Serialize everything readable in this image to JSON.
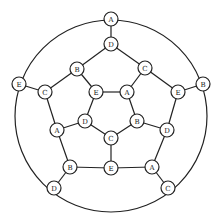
{
  "diagram": {
    "type": "graph",
    "outer_circle": {
      "cx": 111,
      "cy": 116,
      "r": 96
    },
    "nodes": [
      {
        "id": "n0",
        "label": "A",
        "x": 111,
        "y": 19
      },
      {
        "id": "n1",
        "label": "B",
        "x": 203,
        "y": 84
      },
      {
        "id": "n2",
        "label": "C",
        "x": 168,
        "y": 188
      },
      {
        "id": "n3",
        "label": "D",
        "x": 54,
        "y": 188
      },
      {
        "id": "n4",
        "label": "E",
        "x": 19,
        "y": 84
      },
      {
        "id": "m0",
        "label": "D",
        "x": 111,
        "y": 44
      },
      {
        "id": "m1",
        "label": "C",
        "x": 145,
        "y": 68
      },
      {
        "id": "m2",
        "label": "E",
        "x": 178,
        "y": 92
      },
      {
        "id": "m3",
        "label": "D",
        "x": 167,
        "y": 130
      },
      {
        "id": "m4",
        "label": "A",
        "x": 152,
        "y": 167
      },
      {
        "id": "m5",
        "label": "E",
        "x": 111,
        "y": 168
      },
      {
        "id": "m6",
        "label": "B",
        "x": 70,
        "y": 167
      },
      {
        "id": "m7",
        "label": "A",
        "x": 57,
        "y": 130
      },
      {
        "id": "m8",
        "label": "C",
        "x": 45,
        "y": 92
      },
      {
        "id": "m9",
        "label": "B",
        "x": 77,
        "y": 69
      },
      {
        "id": "i0",
        "label": "E",
        "x": 96,
        "y": 92
      },
      {
        "id": "i1",
        "label": "A",
        "x": 127,
        "y": 92
      },
      {
        "id": "i2",
        "label": "B",
        "x": 137,
        "y": 121
      },
      {
        "id": "i3",
        "label": "C",
        "x": 111,
        "y": 138
      },
      {
        "id": "i4",
        "label": "D",
        "x": 85,
        "y": 121
      }
    ],
    "edges": [
      [
        "n0",
        "m0"
      ],
      [
        "n1",
        "m2"
      ],
      [
        "n2",
        "m4"
      ],
      [
        "n3",
        "m6"
      ],
      [
        "n4",
        "m8"
      ],
      [
        "m0",
        "m1"
      ],
      [
        "m1",
        "m2"
      ],
      [
        "m2",
        "m3"
      ],
      [
        "m3",
        "m4"
      ],
      [
        "m4",
        "m5"
      ],
      [
        "m5",
        "m6"
      ],
      [
        "m6",
        "m7"
      ],
      [
        "m7",
        "m8"
      ],
      [
        "m8",
        "m9"
      ],
      [
        "m9",
        "m0"
      ],
      [
        "m9",
        "i0"
      ],
      [
        "m1",
        "i1"
      ],
      [
        "m3",
        "i2"
      ],
      [
        "m5",
        "i3"
      ],
      [
        "m7",
        "i4"
      ],
      [
        "i0",
        "i1"
      ],
      [
        "i1",
        "i2"
      ],
      [
        "i2",
        "i3"
      ],
      [
        "i3",
        "i4"
      ],
      [
        "i4",
        "i0"
      ]
    ]
  }
}
